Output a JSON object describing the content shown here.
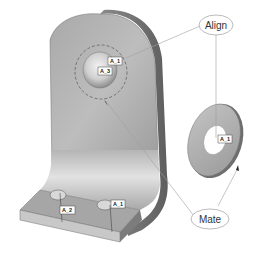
{
  "diagram": {
    "callouts": {
      "align": {
        "label": "Align"
      },
      "mate": {
        "label": "Mate"
      }
    },
    "datum_tags": {
      "bracket_hole_top_a": "A_1",
      "bracket_hole_top_b": "A_3",
      "bracket_base_left": "A_2",
      "bracket_base_right": "A_1",
      "washer": "A_1"
    },
    "colors": {
      "part_face": "#b4b4b4",
      "part_shadow": "#7a7a7a",
      "part_highlight": "#e6e6e6",
      "leader_line": "#999999",
      "callout_border": "#aaaaaa"
    }
  }
}
